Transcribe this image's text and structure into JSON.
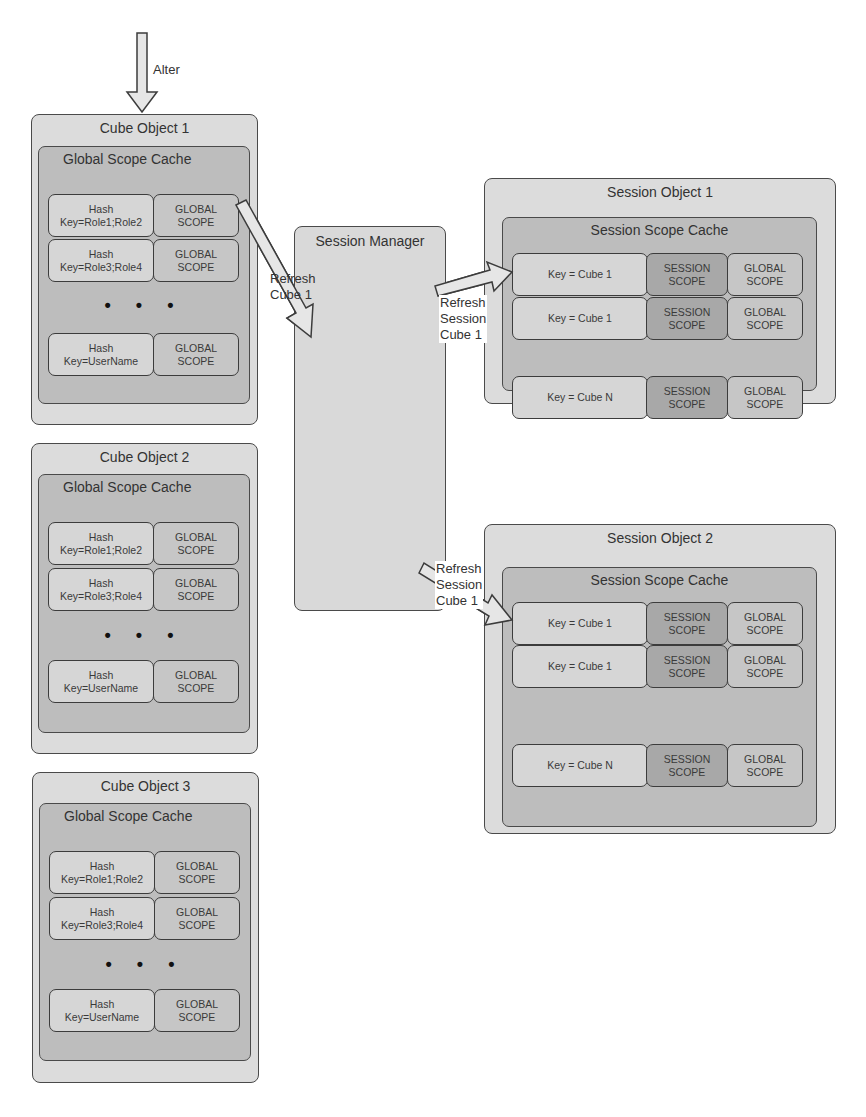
{
  "alter_label": "Alter",
  "cube_objects": [
    {
      "title": "Cube Object 1",
      "cache_title": "Global Scope Cache",
      "rows": [
        {
          "hash": "Hash\nKey=Role1;Role2",
          "scope": "GLOBAL\nSCOPE"
        },
        {
          "hash": "Hash\nKey=Role3;Role4",
          "scope": "GLOBAL\nSCOPE"
        },
        {
          "hash": "Hash\nKey=UserName",
          "scope": "GLOBAL\nSCOPE"
        }
      ],
      "ellipsis": "• • •"
    },
    {
      "title": "Cube Object 2",
      "cache_title": "Global Scope Cache",
      "rows": [
        {
          "hash": "Hash\nKey=Role1;Role2",
          "scope": "GLOBAL\nSCOPE"
        },
        {
          "hash": "Hash\nKey=Role3;Role4",
          "scope": "GLOBAL\nSCOPE"
        },
        {
          "hash": "Hash\nKey=UserName",
          "scope": "GLOBAL\nSCOPE"
        }
      ],
      "ellipsis": "• • •"
    },
    {
      "title": "Cube Object 3",
      "cache_title": "Global Scope Cache",
      "rows": [
        {
          "hash": "Hash\nKey=Role1;Role2",
          "scope": "GLOBAL\nSCOPE"
        },
        {
          "hash": "Hash\nKey=Role3;Role4",
          "scope": "GLOBAL\nSCOPE"
        },
        {
          "hash": "Hash\nKey=UserName",
          "scope": "GLOBAL\nSCOPE"
        }
      ],
      "ellipsis": "• • •"
    }
  ],
  "session_manager": {
    "title": "Session Manager"
  },
  "refresh_cube_label": "Refresh\nCube 1",
  "refresh_session_label_1": "Refresh\nSession\nCube 1",
  "refresh_session_label_2": "Refresh\nSession\nCube 1",
  "session_objects": [
    {
      "title": "Session Object 1",
      "cache_title": "Session Scope Cache",
      "rows": [
        {
          "key": "Key = Cube 1",
          "session": "SESSION\nSCOPE",
          "global": "GLOBAL\nSCOPE"
        },
        {
          "key": "Key = Cube 1",
          "session": "SESSION\nSCOPE",
          "global": "GLOBAL\nSCOPE"
        },
        {
          "key": "Key = Cube N",
          "session": "SESSION\nSCOPE",
          "global": "GLOBAL\nSCOPE"
        }
      ]
    },
    {
      "title": "Session Object 2",
      "cache_title": "Session Scope Cache",
      "rows": [
        {
          "key": "Key = Cube 1",
          "session": "SESSION\nSCOPE",
          "global": "GLOBAL\nSCOPE"
        },
        {
          "key": "Key = Cube 1",
          "session": "SESSION\nSCOPE",
          "global": "GLOBAL\nSCOPE"
        },
        {
          "key": "Key = Cube N",
          "session": "SESSION\nSCOPE",
          "global": "GLOBAL\nSCOPE"
        }
      ]
    }
  ]
}
